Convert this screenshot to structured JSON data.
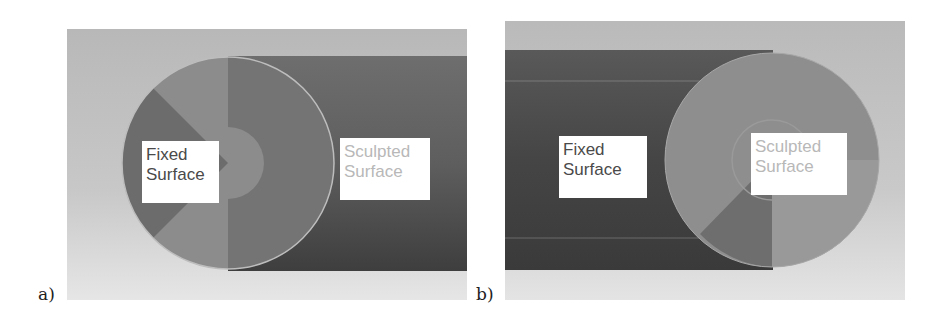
{
  "figure": {
    "panels": [
      {
        "id": "a",
        "letter": "a)",
        "labels": {
          "fixed": [
            "Fixed",
            "Surface"
          ],
          "sculpted": [
            "Sculpted",
            "Surface"
          ]
        },
        "description": "Circular fixed surface at left end, sculpted surface along cylinder to the right"
      },
      {
        "id": "b",
        "letter": "b)",
        "labels": {
          "fixed": [
            "Fixed",
            "Surface"
          ],
          "sculpted": [
            "Sculpted",
            "Surface"
          ]
        },
        "description": "Fixed surface along cylinder on left, sculpted circular surface at right end"
      }
    ],
    "colors": {
      "background_light": "#e6e6e6",
      "background_mid": "#bdbdbd",
      "tube_dark": "#505050",
      "disc_mid": "#8a8a8a",
      "disc_dark": "#6f6f6f",
      "label_bg": "#ffffff",
      "fixed_text": "#4a4a4a",
      "sculpted_text": "#b8b8b8"
    }
  }
}
